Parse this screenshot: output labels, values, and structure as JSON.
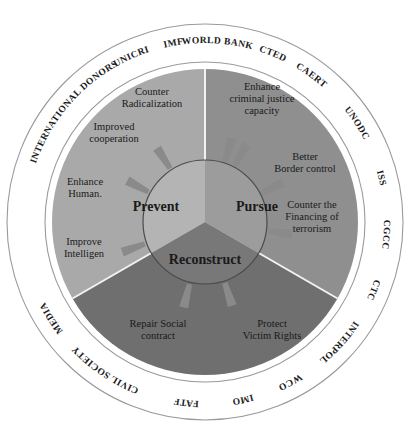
{
  "diagram": {
    "colors": {
      "background": "#ffffff",
      "outer_ring_fill": "#ffffff",
      "outer_ring_stroke": "#9a9a9a",
      "prevent_sector": "#a9a9a9",
      "pursue_sector": "#8f8f8f",
      "reconstruct_sector": "#6f6f6f",
      "inner_prevent": "#b4b4b4",
      "inner_pursue": "#9c9c9c",
      "inner_reconstruct": "#787878",
      "divider": "#f2f2f2",
      "inner_circle_stroke": "#4a4a4a",
      "arrow_fill": "#8a8a8a",
      "text": "#1a1a1a"
    },
    "outer_ring": {
      "name": "stakeholders",
      "labels": [
        {
          "text": "INTERNATIONAL DONORS",
          "angle": -140
        },
        {
          "text": "UNICRI",
          "angle": -114
        },
        {
          "text": "IMF",
          "angle": -100
        },
        {
          "text": "WORLD BANK",
          "angle": -86
        },
        {
          "text": "CTED",
          "angle": -68
        },
        {
          "text": "CAERT",
          "angle": -54
        },
        {
          "text": "UNODC",
          "angle": -33
        },
        {
          "text": "ISS",
          "angle": -14
        },
        {
          "text": "CGCC",
          "angle": 4
        },
        {
          "text": "CTC",
          "angle": 22
        },
        {
          "text": "INTERPOL",
          "angle": 42
        },
        {
          "text": "WCO",
          "angle": 62
        },
        {
          "text": "IMO",
          "angle": 78
        },
        {
          "text": "FATF",
          "angle": 96
        },
        {
          "text": "CIVIL SOCIETY",
          "angle": 124
        },
        {
          "text": "MEDIA",
          "angle": 148
        }
      ]
    },
    "sectors": [
      {
        "id": "prevent",
        "label": "Prevent",
        "start_angle": -90,
        "end_angle": -210
      },
      {
        "id": "pursue",
        "label": "Pursue",
        "start_angle": -90,
        "end_angle": 30
      },
      {
        "id": "reconstruct",
        "label": "Reconstruct",
        "start_angle": 30,
        "end_angle": 150
      }
    ],
    "actions": [
      {
        "sector": "prevent",
        "lines": [
          "Counter",
          "Radicalization"
        ],
        "x": 152,
        "y": 95,
        "arrow_angle": -72
      },
      {
        "sector": "prevent",
        "lines": [
          "Improved",
          "cooperation"
        ],
        "x": 114,
        "y": 130,
        "arrow_angle": -123
      },
      {
        "sector": "prevent",
        "lines": [
          "Enhance",
          "Human."
        ],
        "x": 85,
        "y": 185,
        "arrow_angle": -152
      },
      {
        "sector": "prevent",
        "lines": [
          "Improve",
          "Intelligen"
        ],
        "x": 84,
        "y": 245,
        "arrow_angle": 160
      },
      {
        "sector": "pursue",
        "lines": [
          "Enhance",
          "criminal justice",
          "capacity"
        ],
        "x": 262,
        "y": 90,
        "arrow_angle": -62
      },
      {
        "sector": "pursue",
        "lines": [
          "Better",
          "Border control"
        ],
        "x": 305,
        "y": 160,
        "arrow_angle": -27
      },
      {
        "sector": "pursue",
        "lines": [
          "Counter the",
          "Financing of",
          "terrorism"
        ],
        "x": 312,
        "y": 208,
        "arrow_angle": 8
      },
      {
        "sector": "reconstruct",
        "lines": [
          "Repair Social",
          "contract"
        ],
        "x": 158,
        "y": 327,
        "arrow_angle": 104
      },
      {
        "sector": "reconstruct",
        "lines": [
          "Protect",
          "Victim Rights"
        ],
        "x": 272,
        "y": 327,
        "arrow_angle": 72
      }
    ],
    "pillars": [
      {
        "id": "prevent",
        "label": "Prevent",
        "x": 156,
        "y": 211
      },
      {
        "id": "pursue",
        "label": "Pursue",
        "x": 257,
        "y": 211
      },
      {
        "id": "reconstruct",
        "label": "Reconstruct",
        "x": 205,
        "y": 264
      }
    ],
    "geometry": {
      "cx": 205,
      "cy": 222,
      "r_outer": 198,
      "r_ring_inner": 160,
      "r_sector": 153,
      "r_inner_circle": 62,
      "r_label_ring": 179
    }
  }
}
